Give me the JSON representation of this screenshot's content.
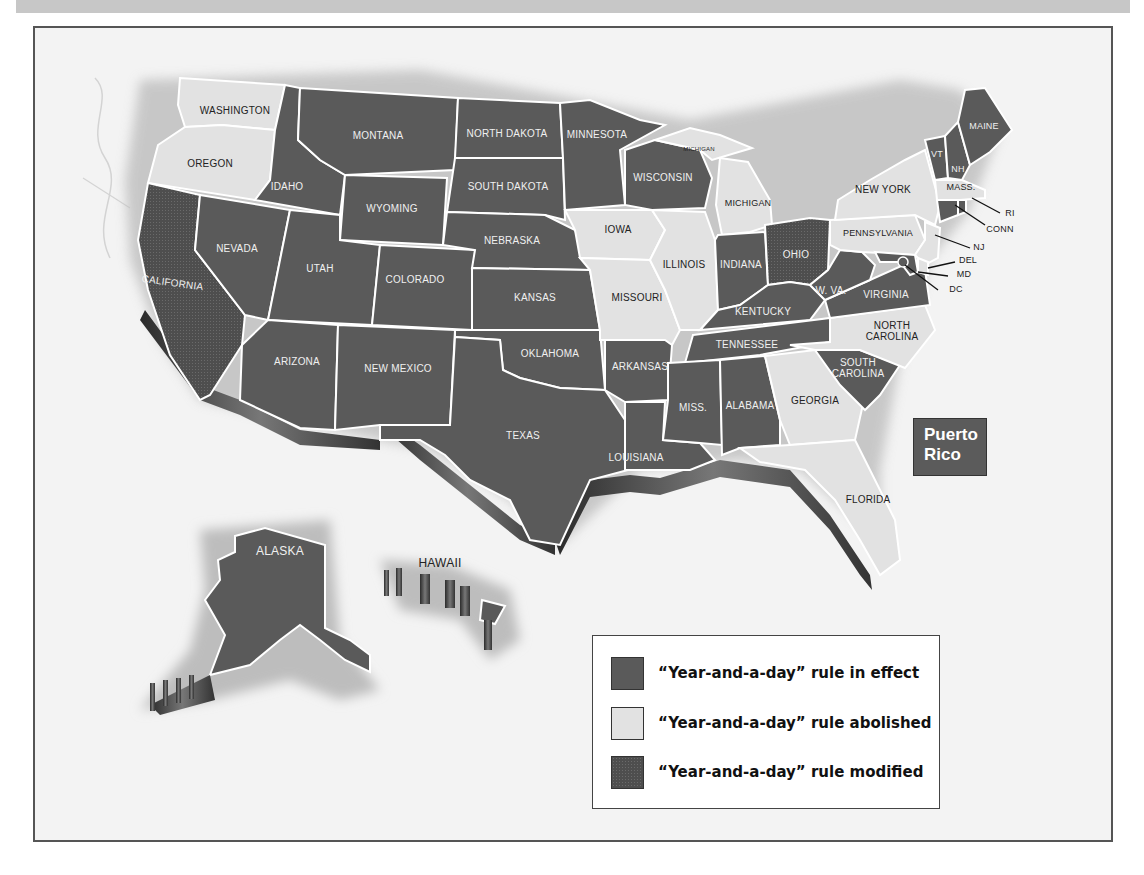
{
  "map": {
    "title": "",
    "colors": {
      "in_effect": "#5a5a5a",
      "abolished": "#e2e2e2",
      "modified": "#4e4e4e",
      "background": "#f3f3f3",
      "border": "#ffffff"
    },
    "states": {
      "washington": {
        "label": "WASHINGTON",
        "status": "abolished"
      },
      "oregon": {
        "label": "OREGON",
        "status": "abolished"
      },
      "california": {
        "label": "CALIFORNIA",
        "status": "modified"
      },
      "idaho": {
        "label": "IDAHO",
        "status": "in_effect"
      },
      "nevada": {
        "label": "NEVADA",
        "status": "in_effect"
      },
      "montana": {
        "label": "MONTANA",
        "status": "in_effect"
      },
      "wyoming": {
        "label": "WYOMING",
        "status": "in_effect"
      },
      "utah": {
        "label": "UTAH",
        "status": "in_effect"
      },
      "arizona": {
        "label": "ARIZONA",
        "status": "in_effect"
      },
      "colorado": {
        "label": "COLORADO",
        "status": "in_effect"
      },
      "new_mexico": {
        "label": "NEW MEXICO",
        "status": "in_effect"
      },
      "north_dakota": {
        "label": "NORTH DAKOTA",
        "status": "in_effect"
      },
      "south_dakota": {
        "label": "SOUTH DAKOTA",
        "status": "in_effect"
      },
      "nebraska": {
        "label": "NEBRASKA",
        "status": "in_effect"
      },
      "kansas": {
        "label": "KANSAS",
        "status": "in_effect"
      },
      "oklahoma": {
        "label": "OKLAHOMA",
        "status": "in_effect"
      },
      "texas": {
        "label": "TEXAS",
        "status": "in_effect"
      },
      "minnesota": {
        "label": "MINNESOTA",
        "status": "in_effect"
      },
      "iowa": {
        "label": "IOWA",
        "status": "abolished"
      },
      "missouri": {
        "label": "MISSOURI",
        "status": "abolished"
      },
      "arkansas": {
        "label": "ARKANSAS",
        "status": "in_effect"
      },
      "louisiana": {
        "label": "LOUISIANA",
        "status": "in_effect"
      },
      "wisconsin": {
        "label": "WISCONSIN",
        "status": "in_effect"
      },
      "illinois": {
        "label": "ILLINOIS",
        "status": "abolished"
      },
      "michigan_upper": {
        "label": "MICHIGAN",
        "status": "abolished"
      },
      "michigan": {
        "label": "MICHIGAN",
        "status": "abolished"
      },
      "indiana": {
        "label": "INDIANA",
        "status": "in_effect"
      },
      "ohio": {
        "label": "OHIO",
        "status": "modified"
      },
      "kentucky": {
        "label": "KENTUCKY",
        "status": "in_effect"
      },
      "tennessee": {
        "label": "TENNESSEE",
        "status": "in_effect"
      },
      "mississippi": {
        "label": "MISS.",
        "status": "in_effect"
      },
      "alabama": {
        "label": "ALABAMA",
        "status": "in_effect"
      },
      "georgia": {
        "label": "GEORGIA",
        "status": "abolished"
      },
      "florida": {
        "label": "FLORIDA",
        "status": "abolished"
      },
      "south_carolina": {
        "label": "SOUTH CAROLINA",
        "label_lines": [
          "SOUTH",
          "CAROLINA"
        ],
        "status": "in_effect"
      },
      "north_carolina": {
        "label": "NORTH CAROLINA",
        "label_lines": [
          "NORTH",
          "CAROLINA"
        ],
        "status": "abolished"
      },
      "virginia": {
        "label": "VIRGINIA",
        "status": "in_effect"
      },
      "west_virginia": {
        "label": "W. VA.",
        "status": "in_effect"
      },
      "pennsylvania": {
        "label": "PENNSYLVANIA",
        "status": "abolished"
      },
      "new_york": {
        "label": "NEW YORK",
        "status": "abolished"
      },
      "vermont": {
        "label": "VT",
        "status": "in_effect"
      },
      "new_hampshire": {
        "label": "NH",
        "status": "in_effect"
      },
      "maine": {
        "label": "MAINE",
        "status": "in_effect"
      },
      "massachusetts": {
        "label": "MASS.",
        "status": "abolished"
      },
      "rhode_island": {
        "label": "RI",
        "status": "in_effect"
      },
      "connecticut": {
        "label": "CONN",
        "status": "in_effect"
      },
      "new_jersey": {
        "label": "NJ",
        "status": "abolished"
      },
      "delaware": {
        "label": "DEL",
        "status": "abolished"
      },
      "maryland": {
        "label": "MD",
        "status": "in_effect"
      },
      "dc": {
        "label": "DC",
        "status": "in_effect"
      },
      "alaska": {
        "label": "ALASKA",
        "status": "in_effect"
      },
      "hawaii": {
        "label": "HAWAII",
        "status": "in_effect"
      }
    },
    "puerto_rico": {
      "label_line1": "Puerto",
      "label_line2": "Rico",
      "status": "in_effect"
    }
  },
  "legend": {
    "items": [
      {
        "label": "“Year-and-a-day” rule in effect",
        "status": "in_effect",
        "color": "#5a5a5a"
      },
      {
        "label": "“Year-and-a-day” rule abolished",
        "status": "abolished",
        "color": "#e2e2e2"
      },
      {
        "label": "“Year-and-a-day” rule modified",
        "status": "modified",
        "color": "#4e4e4e"
      }
    ]
  }
}
